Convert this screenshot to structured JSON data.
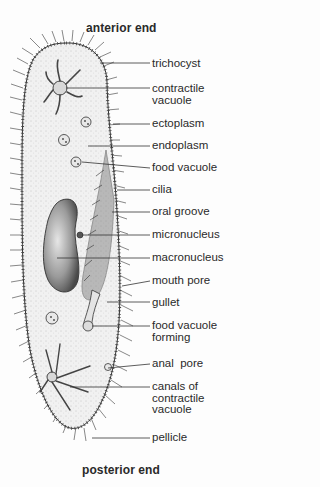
{
  "diagram": {
    "top_label": "anterior end",
    "bottom_label": "posterior end",
    "labels": [
      {
        "id": "trichocyst",
        "text": "trichocyst",
        "y": 58,
        "lx": 100,
        "ly": 63
      },
      {
        "id": "contractile-vacuole",
        "text": "contractile\nvacuole",
        "y": 83,
        "lx": 66,
        "ly": 88
      },
      {
        "id": "ectoplasm",
        "text": "ectoplasm",
        "y": 118,
        "lx": 113,
        "ly": 124
      },
      {
        "id": "endoplasm",
        "text": "endoplasm",
        "y": 140,
        "lx": 88,
        "ly": 146
      },
      {
        "id": "food-vacuole",
        "text": "food vacuole",
        "y": 162,
        "lx": 82,
        "ly": 162
      },
      {
        "id": "cilia",
        "text": "cilia",
        "y": 184,
        "lx": 117,
        "ly": 190
      },
      {
        "id": "oral-groove",
        "text": "oral groove",
        "y": 206,
        "lx": 112,
        "ly": 212
      },
      {
        "id": "micronucleus",
        "text": "micronucleus",
        "y": 229,
        "lx": 82,
        "ly": 235
      },
      {
        "id": "macronucleus",
        "text": "macronucleus",
        "y": 252,
        "lx": 57,
        "ly": 258
      },
      {
        "id": "mouth-pore",
        "text": "mouth pore",
        "y": 275,
        "lx": 122,
        "ly": 286
      },
      {
        "id": "gullet",
        "text": "gullet",
        "y": 297,
        "lx": 107,
        "ly": 302
      },
      {
        "id": "food-vacuole-forming",
        "text": "food vacuole\nforming",
        "y": 320,
        "lx": 92,
        "ly": 326
      },
      {
        "id": "anal-pore",
        "text": "anal  pore",
        "y": 358,
        "lx": 108,
        "ly": 368
      },
      {
        "id": "canals-of-contractile-vacuole",
        "text": "canals of\ncontractile\nvacuole",
        "y": 381,
        "lx": 70,
        "ly": 387
      },
      {
        "id": "pellicle",
        "text": "pellicle",
        "y": 432,
        "lx": 92,
        "ly": 438
      }
    ]
  }
}
